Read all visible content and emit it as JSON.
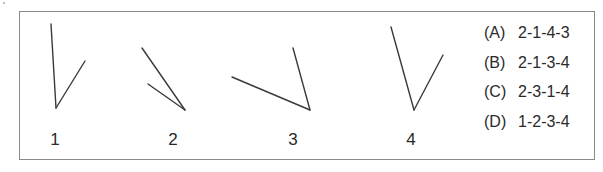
{
  "figures": [
    {
      "label": "1",
      "label_x": 55,
      "lines": [
        {
          "x1": 51,
          "y1": 24,
          "x2": 56,
          "y2": 108
        },
        {
          "x1": 56,
          "y1": 108,
          "x2": 85,
          "y2": 61
        }
      ]
    },
    {
      "label": "2",
      "label_x": 173,
      "lines": [
        {
          "x1": 142,
          "y1": 48,
          "x2": 185,
          "y2": 110
        },
        {
          "x1": 148,
          "y1": 84,
          "x2": 185,
          "y2": 110
        }
      ]
    },
    {
      "label": "3",
      "label_x": 293,
      "lines": [
        {
          "x1": 232,
          "y1": 77,
          "x2": 310,
          "y2": 110
        },
        {
          "x1": 293,
          "y1": 48,
          "x2": 310,
          "y2": 110
        }
      ]
    },
    {
      "label": "4",
      "label_x": 411,
      "lines": [
        {
          "x1": 391,
          "y1": 27,
          "x2": 414,
          "y2": 110
        },
        {
          "x1": 414,
          "y1": 110,
          "x2": 443,
          "y2": 55
        }
      ]
    }
  ],
  "options": [
    {
      "letter": "(A)",
      "answer": "2-1-4-3"
    },
    {
      "letter": "(B)",
      "answer": "2-1-3-4"
    },
    {
      "letter": "(C)",
      "answer": "2-3-1-4"
    },
    {
      "letter": "(D)",
      "answer": "1-2-3-4"
    }
  ],
  "colors": {
    "line": "#3a3a3a",
    "frame": "#8a8a8a",
    "text": "#2a2a2a"
  }
}
